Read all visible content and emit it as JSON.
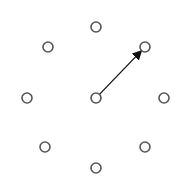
{
  "diagram": {
    "type": "node-ring-with-arrow",
    "node_radius": 5,
    "stroke_color": "#555555",
    "fill_color": "#ffffff",
    "arrow_color": "#111111",
    "nodes": [
      {
        "id": "top",
        "x": 96,
        "y": 27
      },
      {
        "id": "upper-left",
        "x": 48,
        "y": 47
      },
      {
        "id": "upper-right",
        "x": 145,
        "y": 47
      },
      {
        "id": "left",
        "x": 27,
        "y": 98
      },
      {
        "id": "center",
        "x": 96,
        "y": 98
      },
      {
        "id": "right",
        "x": 164,
        "y": 98
      },
      {
        "id": "lower-left",
        "x": 45,
        "y": 147
      },
      {
        "id": "lower-right",
        "x": 145,
        "y": 147
      },
      {
        "id": "bottom",
        "x": 96,
        "y": 168
      }
    ],
    "arrow": {
      "from": "center",
      "to": "upper-right"
    }
  }
}
